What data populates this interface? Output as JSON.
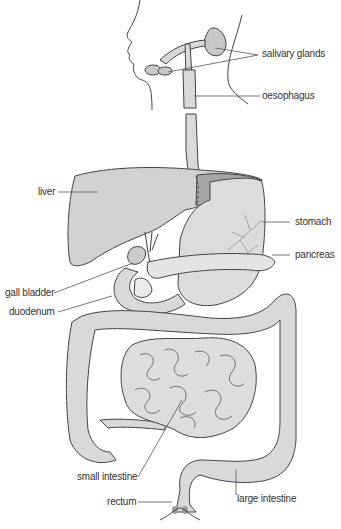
{
  "labels": {
    "salivary_glands": "salivary glands",
    "oesophagus": "oesophagus",
    "liver": "liver",
    "stomach": "stomach",
    "pancreas": "pancreas",
    "gall_bladder": "gall bladder",
    "duodenum": "duodenum",
    "small_intestine": "small intestine",
    "rectum": "rectum",
    "large_intestine": "large intestine"
  },
  "colors": {
    "organ_fill": "#d9d9d9",
    "liver_fill": "#cfcfcf",
    "liver_dark": "#9a9a9a",
    "outline": "#444444",
    "label_text": "#333333",
    "leader_line": "#555555"
  }
}
